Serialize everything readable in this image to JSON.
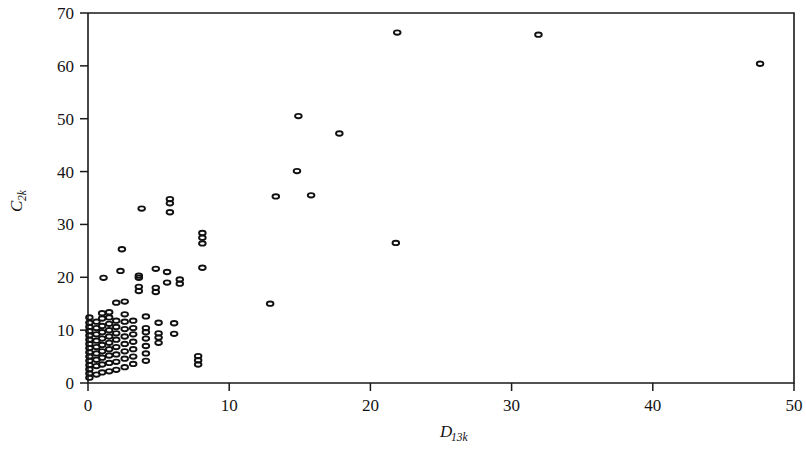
{
  "chart_data": {
    "type": "scatter",
    "title": "",
    "subtitle": "",
    "xlabel": "D",
    "xlabel_sub": "13k",
    "ylabel": "C",
    "ylabel_sub": "2k",
    "xlim": [
      0,
      50
    ],
    "ylim": [
      0,
      70
    ],
    "xticks": [
      0,
      10,
      20,
      30,
      40,
      50
    ],
    "xtick_labels": [
      "0",
      "10",
      "20",
      "30",
      "40",
      "50"
    ],
    "yticks": [
      0,
      10,
      20,
      30,
      40,
      50,
      60,
      70
    ],
    "ytick_labels": [
      "0",
      "10",
      "20",
      "30",
      "40",
      "50",
      "60",
      "70"
    ],
    "grid": false,
    "legend": null,
    "marker": "open-ellipse",
    "marker_color": "#111111",
    "points": [
      [
        0.1,
        1.0
      ],
      [
        0.1,
        1.8
      ],
      [
        0.1,
        2.6
      ],
      [
        0.1,
        3.4
      ],
      [
        0.1,
        4.2
      ],
      [
        0.1,
        5.0
      ],
      [
        0.1,
        5.8
      ],
      [
        0.1,
        6.6
      ],
      [
        0.1,
        7.4
      ],
      [
        0.1,
        8.2
      ],
      [
        0.1,
        9.0
      ],
      [
        0.1,
        9.8
      ],
      [
        0.1,
        10.6
      ],
      [
        0.1,
        11.4
      ],
      [
        0.1,
        12.4
      ],
      [
        0.6,
        1.6
      ],
      [
        0.6,
        3.2
      ],
      [
        0.6,
        4.4
      ],
      [
        0.6,
        5.6
      ],
      [
        0.6,
        6.8
      ],
      [
        0.6,
        8.0
      ],
      [
        0.6,
        9.2
      ],
      [
        0.6,
        10.4
      ],
      [
        0.6,
        11.6
      ],
      [
        1.0,
        2.0
      ],
      [
        1.0,
        3.5
      ],
      [
        1.0,
        4.8
      ],
      [
        1.0,
        6.0
      ],
      [
        1.0,
        7.2
      ],
      [
        1.0,
        8.4
      ],
      [
        1.0,
        9.6
      ],
      [
        1.0,
        10.8
      ],
      [
        1.0,
        12.2
      ],
      [
        1.0,
        13.2
      ],
      [
        1.1,
        19.9
      ],
      [
        1.5,
        2.2
      ],
      [
        1.5,
        3.8
      ],
      [
        1.5,
        5.2
      ],
      [
        1.5,
        6.4
      ],
      [
        1.5,
        7.6
      ],
      [
        1.5,
        8.8
      ],
      [
        1.5,
        10.0
      ],
      [
        1.5,
        11.2
      ],
      [
        1.5,
        12.4
      ],
      [
        1.5,
        13.4
      ],
      [
        2.0,
        2.5
      ],
      [
        2.0,
        4.0
      ],
      [
        2.0,
        5.4
      ],
      [
        2.0,
        6.8
      ],
      [
        2.0,
        8.2
      ],
      [
        2.0,
        9.4
      ],
      [
        2.0,
        10.6
      ],
      [
        2.0,
        11.8
      ],
      [
        2.0,
        15.2
      ],
      [
        2.3,
        21.2
      ],
      [
        2.4,
        25.3
      ],
      [
        2.6,
        3.0
      ],
      [
        2.6,
        4.6
      ],
      [
        2.6,
        6.0
      ],
      [
        2.6,
        7.4
      ],
      [
        2.6,
        8.8
      ],
      [
        2.6,
        10.2
      ],
      [
        2.6,
        11.6
      ],
      [
        2.6,
        13.0
      ],
      [
        2.6,
        15.4
      ],
      [
        3.2,
        3.6
      ],
      [
        3.2,
        5.0
      ],
      [
        3.2,
        6.4
      ],
      [
        3.2,
        7.8
      ],
      [
        3.2,
        9.2
      ],
      [
        3.2,
        10.4
      ],
      [
        3.2,
        11.8
      ],
      [
        3.6,
        17.4
      ],
      [
        3.6,
        18.2
      ],
      [
        3.6,
        19.9
      ],
      [
        3.6,
        20.3
      ],
      [
        3.8,
        33.0
      ],
      [
        4.1,
        4.2
      ],
      [
        4.1,
        5.6
      ],
      [
        4.1,
        7.0
      ],
      [
        4.1,
        8.4
      ],
      [
        4.1,
        9.6
      ],
      [
        4.1,
        10.4
      ],
      [
        4.1,
        12.6
      ],
      [
        4.8,
        17.2
      ],
      [
        4.8,
        18.0
      ],
      [
        4.8,
        21.6
      ],
      [
        5.0,
        7.6
      ],
      [
        5.0,
        8.6
      ],
      [
        5.0,
        9.4
      ],
      [
        5.0,
        11.4
      ],
      [
        5.6,
        19.0
      ],
      [
        5.6,
        21.0
      ],
      [
        5.8,
        32.3
      ],
      [
        5.8,
        34.0
      ],
      [
        5.8,
        34.8
      ],
      [
        6.1,
        9.3
      ],
      [
        6.1,
        11.3
      ],
      [
        6.5,
        18.8
      ],
      [
        6.5,
        19.6
      ],
      [
        7.8,
        3.5
      ],
      [
        7.8,
        4.3
      ],
      [
        7.8,
        5.1
      ],
      [
        8.1,
        21.8
      ],
      [
        8.1,
        26.4
      ],
      [
        8.1,
        27.5
      ],
      [
        8.1,
        28.4
      ],
      [
        12.9,
        15.0
      ],
      [
        13.3,
        35.3
      ],
      [
        14.8,
        40.1
      ],
      [
        14.9,
        50.5
      ],
      [
        15.8,
        35.5
      ],
      [
        17.8,
        47.2
      ],
      [
        21.8,
        26.5
      ],
      [
        21.9,
        66.3
      ],
      [
        31.9,
        65.9
      ],
      [
        47.6,
        60.4
      ]
    ]
  }
}
